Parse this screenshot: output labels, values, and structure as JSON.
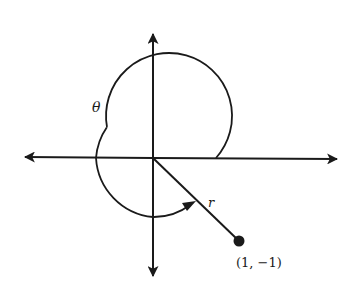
{
  "diagram": {
    "type": "polar-angle",
    "colors": {
      "ink": "#1a1a1a",
      "background": "#ffffff"
    },
    "origin": {
      "x": 153,
      "y": 158
    },
    "axes": {
      "x_axis": {
        "left_arrow_x": 24,
        "right_arrow_x": 338
      },
      "y_axis": {
        "top_arrow_y": 33,
        "bottom_arrow_y": 277
      }
    },
    "angle_arc": {
      "radius": 63,
      "start_deg": 0,
      "end_deg": 315,
      "direction": "counterclockwise",
      "label": "θ"
    },
    "ray": {
      "label": "r",
      "end": {
        "x": 239,
        "y": 241
      }
    },
    "point": {
      "label": "(1, −1)",
      "coords": [
        1,
        -1
      ]
    }
  }
}
